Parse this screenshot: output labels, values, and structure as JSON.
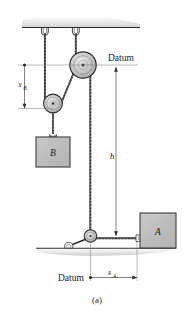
{
  "figure": {
    "caption": "(a)",
    "labels": {
      "datum_top": "Datum",
      "datum_bottom": "Datum",
      "height": "h",
      "s_b_main": "s",
      "s_b_sub": "B",
      "s_a_main": "s",
      "s_a_sub": "A",
      "block_b": "B",
      "block_a": "A"
    },
    "colors": {
      "block_fill": "#bdbdbd",
      "block_stroke": "#3c3c3c",
      "pulley_fill": "#c9c9c9",
      "pulley_stroke": "#2e2e2e",
      "cord": "#2a2a2a",
      "ground": "#d8d8d8",
      "dimension_line": "#6e6e6e",
      "text": "#1a1a1a"
    },
    "elements": {
      "ceiling": "ceiling-support",
      "ground": "ground-support",
      "top_pulley": "top-fixed-pulley",
      "movable_pulley": "movable-pulley",
      "bottom_pulley": "bottom-pulley",
      "cord": "cord-rope",
      "hook_left": "ceiling-hook-left",
      "hook_right": "ceiling-hook-right",
      "hook_block_b": "block-b-hook",
      "hook_block_a": "block-a-hook",
      "strut": "pulley-support-strut"
    }
  }
}
